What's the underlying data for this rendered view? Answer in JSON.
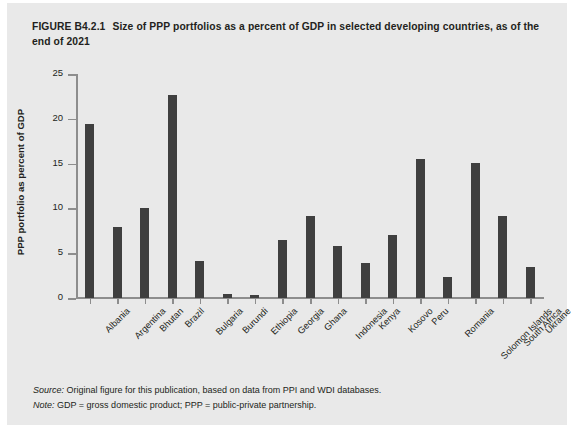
{
  "figure": {
    "number": "FIGURE B4.2.1",
    "title": "Size of PPP portfolios as a percent of GDP in selected developing countries, as of the end of 2021",
    "source_label": "Source:",
    "source_text": " Original figure for this publication, based on data from PPI and WDI databases.",
    "note_label": "Note:",
    "note_text": " GDP = gross domestic product; PPP = public-private partnership."
  },
  "colors": {
    "bar": "#3f3f3f",
    "panel_background": "#e9e9e9",
    "axis": "#8d8d8d",
    "text": "#231f20"
  },
  "chart_data": {
    "type": "bar",
    "title": "Size of PPP portfolios as a percent of GDP in selected developing countries, as of the end of 2021",
    "xlabel": "",
    "ylabel": "PPP portfolio as percent of GDP",
    "ylim": [
      0,
      25
    ],
    "yticks": [
      0,
      5,
      10,
      15,
      20,
      25
    ],
    "grid": false,
    "legend": "none",
    "categories": [
      "Albania",
      "Argentina",
      "Bhutan",
      "Brazil",
      "Bulgaria",
      "Burundi",
      "Ethiopia",
      "Georgia",
      "Ghana",
      "Indonesia",
      "Kenya",
      "Kosovo",
      "Peru",
      "Romania",
      "Solomon Islands",
      "South Africa",
      "Ukraine"
    ],
    "values": [
      19.4,
      7.9,
      10.1,
      22.7,
      4.1,
      0.4,
      0.3,
      6.5,
      9.2,
      5.8,
      3.9,
      7.0,
      15.5,
      2.3,
      15.1,
      9.1,
      3.5
    ]
  }
}
